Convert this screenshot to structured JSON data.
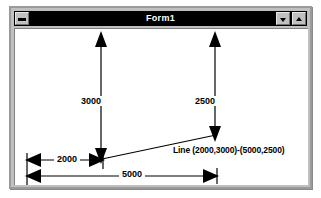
{
  "window": {
    "title": "Form1",
    "sysmenu_icon": "system-menu-icon",
    "minimize_icon": "triangle-down-icon",
    "maximize_icon": "triangle-up-icon",
    "frame_color": "#c0c0c0",
    "titlebar_color": "#000000",
    "titlebar_text_color": "#ffffff",
    "client_color": "#ffffff"
  },
  "diagram": {
    "labels": {
      "vertical_left": "3000",
      "vertical_right": "2500",
      "horizontal_short": "2000",
      "horizontal_long": "5000",
      "caption": "Line (2000,3000)-(5000,2500)"
    },
    "stroke_color": "#000000",
    "line_start": "(2000,3000)",
    "line_end": "(5000,2500)"
  }
}
